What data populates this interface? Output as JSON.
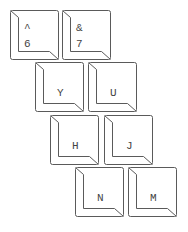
{
  "diagram": {
    "title": "",
    "stroke_color": "#5a5a5a",
    "text_color": "#444444",
    "background": "#ffffff",
    "keys": [
      {
        "id": "key-6",
        "shift": "^",
        "main": "6",
        "x": 10,
        "y": 10
      },
      {
        "id": "key-7",
        "shift": "&",
        "main": "7",
        "x": 62,
        "y": 10
      },
      {
        "id": "key-y",
        "shift": "",
        "main": "Y",
        "x": 35,
        "y": 62
      },
      {
        "id": "key-u",
        "shift": "",
        "main": "U",
        "x": 88,
        "y": 62
      },
      {
        "id": "key-h",
        "shift": "",
        "main": "H",
        "x": 50,
        "y": 115
      },
      {
        "id": "key-j",
        "shift": "",
        "main": "J",
        "x": 104,
        "y": 115
      },
      {
        "id": "key-n",
        "shift": "",
        "main": "N",
        "x": 75,
        "y": 167
      },
      {
        "id": "key-m",
        "shift": "",
        "main": "M",
        "x": 128,
        "y": 167
      }
    ]
  }
}
